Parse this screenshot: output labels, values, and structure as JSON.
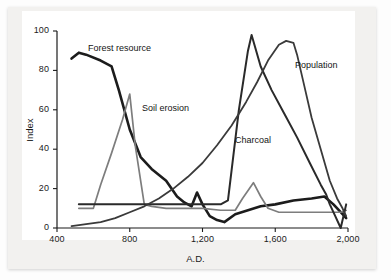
{
  "chart_data": {
    "type": "line",
    "title": "",
    "xlabel": "A.D.",
    "ylabel": "Index",
    "xlim": [
      400,
      2000
    ],
    "ylim": [
      0,
      100
    ],
    "xticks": [
      400,
      800,
      1200,
      1600,
      2000
    ],
    "xtick_labels": [
      "400",
      "800",
      "1,200",
      "1,600",
      "2,000"
    ],
    "yticks": [
      0,
      20,
      40,
      60,
      80,
      100
    ],
    "ytick_labels": [
      "0",
      "20",
      "40",
      "60",
      "80",
      "100"
    ],
    "grid": false,
    "legend_position": "inline-annotations",
    "series": [
      {
        "name": "Forest resource",
        "color": "#1c1c1c",
        "width": 2.6,
        "x": [
          480,
          520,
          560,
          640,
          700,
          740,
          800,
          860,
          920,
          1000,
          1060,
          1100,
          1140,
          1170,
          1200,
          1240,
          1280,
          1320,
          1380,
          1450,
          1520,
          1600,
          1700,
          1800,
          1870,
          1920,
          1960,
          1990
        ],
        "y": [
          86,
          89,
          88,
          85,
          82,
          70,
          50,
          36,
          30,
          24,
          16,
          13,
          11,
          18,
          12,
          6,
          4,
          3,
          7,
          9,
          11,
          12,
          14,
          15,
          16,
          12,
          8,
          5
        ]
      },
      {
        "name": "Soil erosion",
        "color": "#7d7d7d",
        "width": 1.7,
        "x": [
          520,
          600,
          640,
          700,
          760,
          800,
          830,
          880,
          920,
          1000,
          1100,
          1200,
          1300,
          1380,
          1420,
          1480,
          1520,
          1560,
          1620,
          1700,
          1800,
          1880,
          1930,
          1960,
          1990
        ],
        "y": [
          10,
          10,
          22,
          38,
          55,
          68,
          42,
          12,
          11,
          10,
          10,
          10,
          9,
          9,
          15,
          23,
          16,
          10,
          8,
          8,
          8,
          8,
          8,
          8,
          9
        ]
      },
      {
        "name": "Charcoal",
        "color": "#2a2a2a",
        "width": 2.0,
        "x": [
          520,
          600,
          700,
          800,
          900,
          1000,
          1080,
          1160,
          1240,
          1300,
          1340,
          1400,
          1450,
          1470,
          1520,
          1580,
          1650,
          1720,
          1790,
          1850,
          1880,
          1900,
          1930,
          1960,
          1990
        ],
        "y": [
          12,
          12,
          12,
          12,
          12,
          12,
          12,
          12,
          12,
          12,
          14,
          60,
          90,
          98,
          82,
          70,
          58,
          46,
          33,
          22,
          17,
          12,
          6,
          0,
          12
        ]
      },
      {
        "name": "Population",
        "color": "#3a3a3a",
        "width": 1.8,
        "x": [
          480,
          560,
          640,
          720,
          800,
          880,
          960,
          1040,
          1120,
          1200,
          1280,
          1360,
          1440,
          1500,
          1560,
          1620,
          1660,
          1700,
          1720,
          1740,
          1760,
          1800,
          1850,
          1900,
          1940,
          1970,
          1990
        ],
        "y": [
          1,
          2,
          3,
          5,
          8,
          11,
          15,
          20,
          26,
          33,
          42,
          52,
          64,
          74,
          85,
          93,
          95,
          94,
          88,
          80,
          72,
          56,
          40,
          24,
          15,
          10,
          6
        ]
      }
    ],
    "annotations": [
      {
        "text": "Forest resource",
        "x_px": 88,
        "y_px": 43
      },
      {
        "text": "Soil erosion",
        "x_px": 142,
        "y_px": 103
      },
      {
        "text": "Charcoal",
        "x_px": 235,
        "y_px": 135
      },
      {
        "text": "Population",
        "x_px": 295,
        "y_px": 60
      }
    ]
  },
  "axes": {
    "x_title": "A.D.",
    "y_title": "Index"
  }
}
